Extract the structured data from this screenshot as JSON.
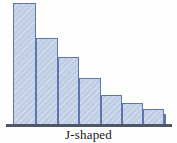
{
  "figure": {
    "caption": "J-shaped",
    "bar_fill_color": "#bfcde5",
    "bar_border_color": "#5b77ad",
    "axis_color": "#4e5668",
    "background_color": "#ffffff"
  },
  "chart_data": {
    "type": "bar",
    "title": "J-shaped",
    "subtitle": "",
    "xlabel": "",
    "ylabel": "",
    "grid": false,
    "legend": null,
    "axis_visible": {
      "x": true,
      "y": false
    },
    "categories": [
      "1",
      "2",
      "3",
      "4",
      "5",
      "6",
      "7",
      "8"
    ],
    "values": [
      122,
      87,
      68,
      47,
      30,
      22,
      16,
      11
    ],
    "ylim": [
      0,
      127
    ],
    "annotations": [
      "J-shaped"
    ]
  },
  "bars": [
    {
      "label": "1",
      "value": 122,
      "left": 13,
      "width": 23
    },
    {
      "label": "2",
      "value": 87,
      "left": 36,
      "width": 22
    },
    {
      "label": "3",
      "value": 68,
      "left": 58,
      "width": 21
    },
    {
      "label": "4",
      "value": 47,
      "left": 79,
      "width": 22
    },
    {
      "label": "5",
      "value": 30,
      "left": 101,
      "width": 21
    },
    {
      "label": "6",
      "value": 22,
      "left": 122,
      "width": 21
    },
    {
      "label": "7",
      "value": 16,
      "left": 143,
      "width": 21
    },
    {
      "label": "8",
      "value": 11,
      "left": 164,
      "width": 0
    }
  ]
}
